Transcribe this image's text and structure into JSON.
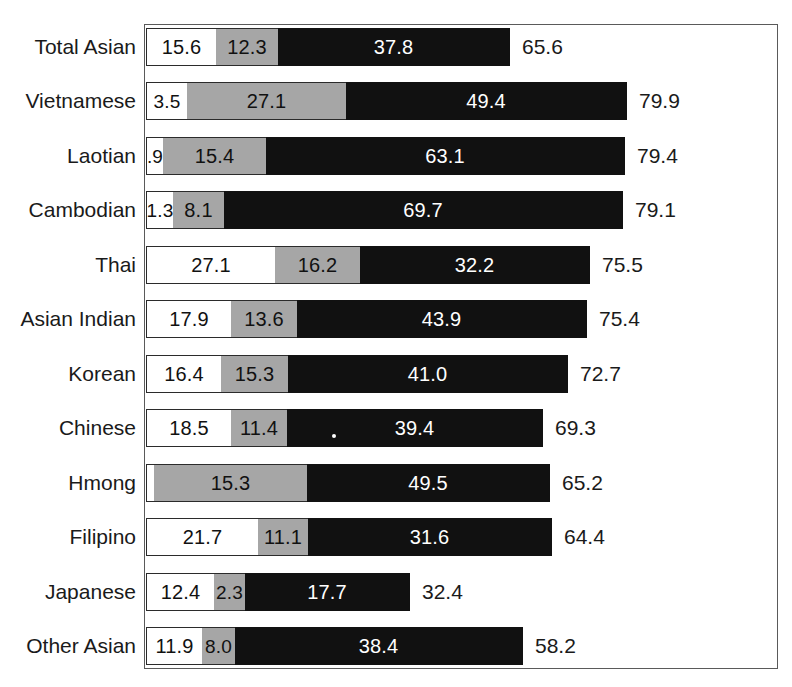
{
  "chart_data": {
    "type": "bar",
    "subtype": "stacked-horizontal",
    "title": "",
    "subtitle": "",
    "xlabel": "",
    "ylabel": "",
    "grid": false,
    "legend_position": "none",
    "series": [
      {
        "name": "segment-1",
        "color": "#ffffff",
        "values": [
          15.6,
          3.5,
          0.9,
          1.3,
          27.1,
          17.9,
          16.4,
          18.5,
          0.4,
          21.7,
          12.4,
          11.9
        ]
      },
      {
        "name": "segment-2",
        "color": "#a6a6a6",
        "values": [
          12.3,
          27.1,
          15.4,
          8.1,
          16.2,
          13.6,
          15.3,
          11.4,
          15.3,
          11.1,
          2.3,
          8.0
        ]
      },
      {
        "name": "segment-3",
        "color": "#111111",
        "values": [
          37.8,
          49.4,
          63.1,
          69.7,
          32.2,
          43.9,
          41.0,
          39.4,
          49.5,
          31.6,
          17.7,
          38.4
        ]
      }
    ],
    "categories": [
      "Total Asian",
      "Vietnamese",
      "Laotian",
      "Cambodian",
      "Thai",
      "Asian Indian",
      "Korean",
      "Chinese",
      "Hmong",
      "Filipino",
      "Japanese",
      "Other Asian"
    ],
    "totals": [
      65.6,
      79.9,
      79.4,
      79.1,
      75.5,
      75.4,
      72.7,
      69.3,
      65.2,
      64.4,
      32.4,
      58.2
    ]
  },
  "colors": {
    "segment_white": "#ffffff",
    "segment_gray": "#a6a6a6",
    "segment_black": "#111111",
    "frame": "#5a5a5a",
    "text": "#1a1a1a",
    "text_on_dark": "#ffffff"
  },
  "rows": [
    {
      "label": "Total Asian",
      "total": "65.6",
      "top": 25,
      "segments": [
        {
          "value": "15.6",
          "tone": "white",
          "width": 70
        },
        {
          "value": "12.3",
          "tone": "gray",
          "width": 62
        },
        {
          "value": "37.8",
          "tone": "black",
          "width": 232
        }
      ]
    },
    {
      "label": "Vietnamese",
      "total": "79.9",
      "top": 79,
      "segments": [
        {
          "value": "3.5",
          "tone": "white",
          "width": 41
        },
        {
          "value": "27.1",
          "tone": "gray",
          "width": 159
        },
        {
          "value": "49.4",
          "tone": "black",
          "width": 281
        }
      ]
    },
    {
      "label": "Laotian",
      "total": "79.4",
      "top": 134,
      "segments": [
        {
          "value": ".9",
          "tone": "white",
          "width": 17
        },
        {
          "value": "15.4",
          "tone": "gray",
          "width": 103
        },
        {
          "value": "63.1",
          "tone": "black",
          "width": 359
        }
      ]
    },
    {
      "label": "Cambodian",
      "total": "79.1",
      "top": 188,
      "segments": [
        {
          "value": "1.3",
          "tone": "white",
          "width": 27
        },
        {
          "value": "8.1",
          "tone": "gray",
          "width": 51
        },
        {
          "value": "69.7",
          "tone": "black",
          "width": 399
        }
      ]
    },
    {
      "label": "Thai",
      "total": "75.5",
      "top": 243,
      "segments": [
        {
          "value": "27.1",
          "tone": "white",
          "width": 129
        },
        {
          "value": "16.2",
          "tone": "gray",
          "width": 85
        },
        {
          "value": "32.2",
          "tone": "black",
          "width": 230
        }
      ]
    },
    {
      "label": "Asian Indian",
      "total": "75.4",
      "top": 297,
      "segments": [
        {
          "value": "17.9",
          "tone": "white",
          "width": 85
        },
        {
          "value": "13.6",
          "tone": "gray",
          "width": 66
        },
        {
          "value": "43.9",
          "tone": "black",
          "width": 290
        }
      ]
    },
    {
      "label": "Korean",
      "total": "72.7",
      "top": 352,
      "segments": [
        {
          "value": "16.4",
          "tone": "white",
          "width": 75
        },
        {
          "value": "15.3",
          "tone": "gray",
          "width": 67
        },
        {
          "value": "41.0",
          "tone": "black",
          "width": 280
        }
      ]
    },
    {
      "label": "Chinese",
      "total": "69.3",
      "top": 406,
      "segments": [
        {
          "value": "18.5",
          "tone": "white",
          "width": 85
        },
        {
          "value": "11.4",
          "tone": "gray",
          "width": 56
        },
        {
          "value": "39.4",
          "tone": "black",
          "width": 256
        }
      ]
    },
    {
      "label": "Hmong",
      "total": "65.2",
      "top": 461,
      "segments": [
        {
          "value": "0.4",
          "tone": "white",
          "width": 8
        },
        {
          "value": "15.3",
          "tone": "gray",
          "width": 153
        },
        {
          "value": "49.5",
          "tone": "black",
          "width": 243
        }
      ]
    },
    {
      "label": "Filipino",
      "total": "64.4",
      "top": 515,
      "segments": [
        {
          "value": "21.7",
          "tone": "white",
          "width": 112
        },
        {
          "value": "11.1",
          "tone": "gray",
          "width": 50
        },
        {
          "value": "31.6",
          "tone": "black",
          "width": 244
        }
      ]
    },
    {
      "label": "Japanese",
      "total": "32.4",
      "top": 570,
      "segments": [
        {
          "value": "12.4",
          "tone": "white",
          "width": 68
        },
        {
          "value": "2.3",
          "tone": "gray",
          "width": 31
        },
        {
          "value": "17.7",
          "tone": "black",
          "width": 165
        }
      ]
    },
    {
      "label": "Other Asian",
      "total": "58.2",
      "top": 624,
      "segments": [
        {
          "value": "11.9",
          "tone": "white",
          "width": 56
        },
        {
          "value": "8.0",
          "tone": "gray",
          "width": 33
        },
        {
          "value": "38.4",
          "tone": "black",
          "width": 288
        }
      ]
    }
  ]
}
